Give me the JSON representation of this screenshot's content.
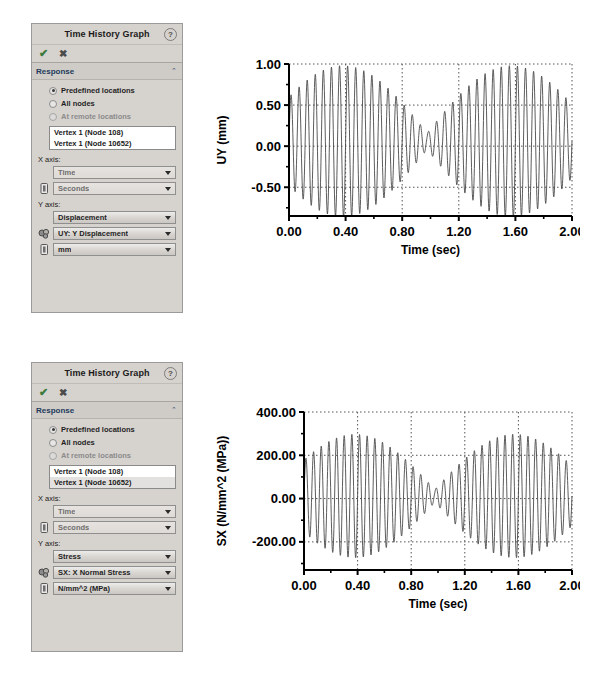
{
  "panels": [
    {
      "title": "Time History Graph",
      "help_icon": "help-icon",
      "ok_glyph": "✔",
      "cancel_glyph": "✖",
      "section": {
        "title": "Response",
        "chevron": "⌃"
      },
      "radios": [
        {
          "label": "Predefined locations",
          "selected": true,
          "disabled": false
        },
        {
          "label": "All nodes",
          "selected": false,
          "disabled": false
        },
        {
          "label": "At remote locations",
          "selected": false,
          "disabled": true
        }
      ],
      "list": [
        {
          "label": "Vertex 1 (Node 108)",
          "selected": false
        },
        {
          "label": "Vertex 1 (Node 10652)",
          "selected": true
        }
      ],
      "x_axis_label": "X axis:",
      "x_quantity": "Time",
      "x_unit": "Seconds",
      "y_axis_label": "Y axis:",
      "y_quantity": "Displacement",
      "y_component": "UY: Y Displacement",
      "y_unit": "mm"
    },
    {
      "title": "Time History Graph",
      "help_icon": "help-icon",
      "ok_glyph": "✔",
      "cancel_glyph": "✖",
      "section": {
        "title": "Response",
        "chevron": "⌃"
      },
      "radios": [
        {
          "label": "Predefined locations",
          "selected": true,
          "disabled": false
        },
        {
          "label": "All nodes",
          "selected": false,
          "disabled": false
        },
        {
          "label": "At remote locations",
          "selected": false,
          "disabled": true
        }
      ],
      "list": [
        {
          "label": "Vertex 1 (Node 108)",
          "selected": false
        },
        {
          "label": "Vertex 1 (Node 10652)",
          "selected": true
        }
      ],
      "x_axis_label": "X axis:",
      "x_quantity": "Time",
      "x_unit": "Seconds",
      "y_axis_label": "Y axis:",
      "y_quantity": "Stress",
      "y_component": "SX: X Normal Stress",
      "y_unit": "N/mm^2 (MPa)"
    }
  ],
  "chart_data": [
    {
      "type": "line",
      "title": "",
      "xlabel": "Time (sec)",
      "ylabel": "UY (mm)",
      "xlim": [
        0.0,
        2.0
      ],
      "ylim": [
        -0.85,
        1.0
      ],
      "xticks": [
        0.0,
        0.4,
        0.8,
        1.2,
        1.6,
        2.0
      ],
      "xtick_labels": [
        "0.00",
        "0.40",
        "0.80",
        "1.20",
        "1.60",
        "2.00"
      ],
      "xtick_minor_step": 0.2,
      "yticks": [
        -0.5,
        0.0,
        0.5,
        1.0
      ],
      "ytick_labels": [
        "-0.50",
        "0.00",
        "0.50",
        "1.00"
      ],
      "ytick_minor_step": 0.25,
      "grid": "dotted",
      "legend": "none",
      "line_color": "#4a4a4a",
      "series": [
        {
          "name": "UY Displacement",
          "model": "beat",
          "carrier_hz": 17.5,
          "beat_hz": 0.84,
          "beat_phase": 0.18,
          "amplitude": 0.92,
          "base_amplitude": 0.1,
          "offset": 0.06,
          "samples": 1400
        }
      ]
    },
    {
      "type": "line",
      "title": "",
      "xlabel": "Time (sec)",
      "ylabel": "SX (N/mm^2 (MPa))",
      "xlim": [
        0.0,
        2.0
      ],
      "ylim": [
        -330.0,
        400.0
      ],
      "xticks": [
        0.0,
        0.4,
        0.8,
        1.2,
        1.6,
        2.0
      ],
      "xtick_labels": [
        "0.00",
        "0.40",
        "0.80",
        "1.20",
        "1.60",
        "2.00"
      ],
      "xtick_minor_step": 0.2,
      "yticks": [
        -200.0,
        0.0,
        200.0,
        400.0
      ],
      "ytick_labels": [
        "-200.00",
        "0.00",
        "200.00",
        "400.00"
      ],
      "ytick_minor_step": 100.0,
      "grid": "dotted",
      "legend": "none",
      "line_color": "#4a4a4a",
      "series": [
        {
          "name": "SX X Normal Stress",
          "model": "beat",
          "carrier_hz": 17.5,
          "beat_hz": 0.84,
          "beat_phase": 0.18,
          "amplitude": 285.0,
          "base_amplitude": 30.0,
          "offset": 12.0,
          "samples": 1400
        }
      ]
    }
  ]
}
